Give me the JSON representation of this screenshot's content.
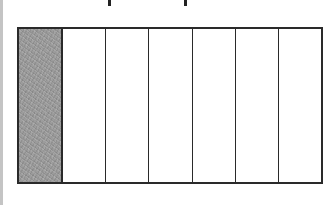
{
  "figure": {
    "title_fragment": "",
    "total_parts": 7,
    "shaded_parts": 1,
    "fraction_label": "1/7",
    "colors": {
      "outline": "#2a2a2a",
      "shaded_fill": "#9c9c9c",
      "unshaded_fill": "#ffffff",
      "left_rule": "#c4c4c4"
    },
    "cells": [
      {
        "index": 1,
        "shaded": true
      },
      {
        "index": 2,
        "shaded": false
      },
      {
        "index": 3,
        "shaded": false
      },
      {
        "index": 4,
        "shaded": false
      },
      {
        "index": 5,
        "shaded": false
      },
      {
        "index": 6,
        "shaded": false
      },
      {
        "index": 7,
        "shaded": false
      }
    ]
  }
}
